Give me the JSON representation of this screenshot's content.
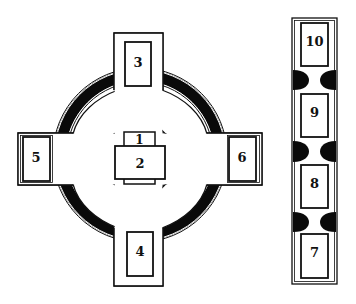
{
  "diagram": {
    "type": "celtic-cross-spread",
    "colors": {
      "line": "#111111",
      "ring": "#0a0a0a",
      "background": "#ffffff"
    },
    "cross": {
      "positions": [
        {
          "id": "1",
          "label": "1",
          "location": "center-behind"
        },
        {
          "id": "2",
          "label": "2",
          "location": "center-crossing"
        },
        {
          "id": "3",
          "label": "3",
          "location": "top"
        },
        {
          "id": "4",
          "label": "4",
          "location": "bottom"
        },
        {
          "id": "5",
          "label": "5",
          "location": "left"
        },
        {
          "id": "6",
          "label": "6",
          "location": "right"
        }
      ]
    },
    "staff": {
      "positions": [
        {
          "id": "10",
          "label": "10",
          "location": "staff-top"
        },
        {
          "id": "9",
          "label": "9",
          "location": "staff-upper"
        },
        {
          "id": "8",
          "label": "8",
          "location": "staff-lower"
        },
        {
          "id": "7",
          "label": "7",
          "location": "staff-bottom"
        }
      ]
    }
  }
}
